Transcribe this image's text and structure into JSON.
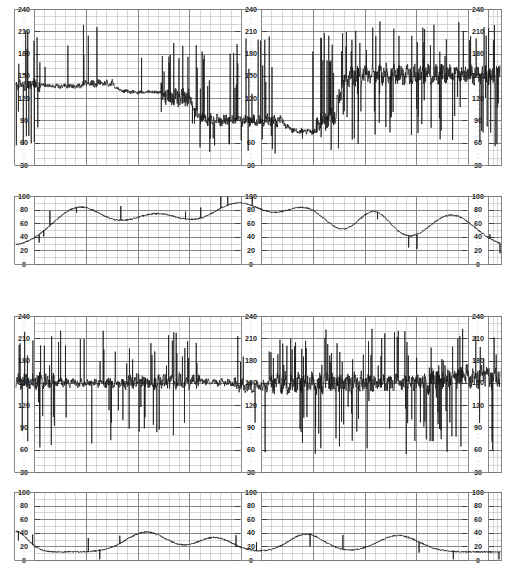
{
  "document": {
    "title": "Cardiotocography (CTG) chart recording",
    "paper": "#ffffff",
    "ink": "#111111",
    "grid_major_color": "#7a7a7a",
    "grid_minor_color": "#b8b8b8",
    "trace_color": "#1a1a1a"
  },
  "panels": [
    {
      "id": "fhr-top",
      "name": "fetal-heart-rate-upper",
      "kind": "fhr",
      "unit": "bpm",
      "y_ticks": [
        240,
        210,
        180,
        150,
        120,
        90,
        60,
        30
      ],
      "ylim": [
        30,
        240
      ],
      "label_columns": [
        "left",
        "middle",
        "right"
      ],
      "minor_cells_x": 40,
      "major_every_x": 5
    },
    {
      "id": "toco-top",
      "name": "uterine-activity-upper",
      "kind": "toco",
      "unit": "",
      "y_ticks": [
        100,
        80,
        60,
        40,
        20,
        0
      ],
      "ylim": [
        0,
        100
      ],
      "label_columns": [
        "left",
        "middle",
        "right"
      ],
      "minor_cells_x": 40,
      "major_every_x": 5
    },
    {
      "id": "fhr-bottom",
      "name": "fetal-heart-rate-lower",
      "kind": "fhr",
      "unit": "bpm",
      "y_ticks": [
        240,
        210,
        180,
        150,
        120,
        90,
        60,
        30
      ],
      "ylim": [
        30,
        240
      ],
      "label_columns": [
        "left",
        "middle",
        "right"
      ],
      "minor_cells_x": 40,
      "major_every_x": 5
    },
    {
      "id": "toco-bottom",
      "name": "uterine-activity-lower",
      "kind": "toco",
      "unit": "",
      "y_ticks": [
        100,
        80,
        60,
        40,
        20,
        0
      ],
      "ylim": [
        0,
        100
      ],
      "label_columns": [
        "left",
        "middle",
        "right"
      ],
      "minor_cells_x": 40,
      "major_every_x": 5
    }
  ],
  "chart_data": [
    {
      "type": "line",
      "id": "fhr-top",
      "title": "Fetal heart rate — upper strip",
      "xlabel": "",
      "ylabel": "bpm",
      "ylim": [
        30,
        240
      ],
      "yticks": [
        30,
        60,
        90,
        120,
        150,
        180,
        210,
        240
      ],
      "grid": true,
      "legend": "none",
      "baseline_segments": [
        {
          "from_pct": 0,
          "to_pct": 5,
          "baseline": 138,
          "variability": 18,
          "spikes": "high"
        },
        {
          "from_pct": 5,
          "to_pct": 13,
          "baseline": 136,
          "variability": 6,
          "spikes": "low"
        },
        {
          "from_pct": 13,
          "to_pct": 20,
          "baseline": 140,
          "variability": 10,
          "spikes": "medium"
        },
        {
          "from_pct": 20,
          "to_pct": 30,
          "baseline": 128,
          "variability": 5,
          "spikes": "low"
        },
        {
          "from_pct": 30,
          "to_pct": 36,
          "baseline": 120,
          "variability": 25,
          "spikes": "high"
        },
        {
          "from_pct": 36,
          "to_pct": 55,
          "baseline": 90,
          "variability": 16,
          "spikes": "high"
        },
        {
          "from_pct": 55,
          "to_pct": 62,
          "baseline": 75,
          "variability": 8,
          "spikes": "low"
        },
        {
          "from_pct": 62,
          "to_pct": 66,
          "baseline": 95,
          "variability": 30,
          "spikes": "high"
        },
        {
          "from_pct": 66,
          "to_pct": 100,
          "baseline": 152,
          "variability": 26,
          "spikes": "high"
        }
      ],
      "annotations": [
        "Prolonged deceleration to ~60-90 bpm in mid strip",
        "Dense signal-loss artefact spikes to 210-240 bpm"
      ]
    },
    {
      "type": "line",
      "id": "toco-top",
      "title": "Uterine activity — upper strip",
      "xlabel": "",
      "ylabel": "",
      "ylim": [
        0,
        100
      ],
      "yticks": [
        0,
        20,
        40,
        60,
        80,
        100
      ],
      "grid": true,
      "legend": "none",
      "resting_tone": 25,
      "contractions": [
        {
          "center_pct": 13,
          "peak": 82,
          "width_pct": 9
        },
        {
          "center_pct": 29,
          "peak": 72,
          "width_pct": 10
        },
        {
          "center_pct": 46,
          "peak": 88,
          "width_pct": 10
        },
        {
          "center_pct": 60,
          "peak": 78,
          "width_pct": 8
        },
        {
          "center_pct": 74,
          "peak": 76,
          "width_pct": 6
        },
        {
          "center_pct": 90,
          "peak": 72,
          "width_pct": 8
        }
      ],
      "annotations": [
        "Six contractions; resting tone ~20-30 units"
      ]
    },
    {
      "type": "line",
      "id": "fhr-bottom",
      "title": "Fetal heart rate — lower strip",
      "xlabel": "",
      "ylabel": "bpm",
      "ylim": [
        30,
        240
      ],
      "yticks": [
        30,
        60,
        90,
        120,
        150,
        180,
        210,
        240
      ],
      "grid": true,
      "legend": "none",
      "baseline_segments": [
        {
          "from_pct": 0,
          "to_pct": 8,
          "baseline": 152,
          "variability": 22,
          "spikes": "high"
        },
        {
          "from_pct": 8,
          "to_pct": 22,
          "baseline": 150,
          "variability": 12,
          "spikes": "medium"
        },
        {
          "from_pct": 22,
          "to_pct": 38,
          "baseline": 152,
          "variability": 20,
          "spikes": "high"
        },
        {
          "from_pct": 38,
          "to_pct": 45,
          "baseline": 150,
          "variability": 10,
          "spikes": "low"
        },
        {
          "from_pct": 45,
          "to_pct": 52,
          "baseline": 145,
          "variability": 16,
          "spikes": "medium"
        },
        {
          "from_pct": 52,
          "to_pct": 72,
          "baseline": 150,
          "variability": 28,
          "spikes": "high"
        },
        {
          "from_pct": 72,
          "to_pct": 85,
          "baseline": 150,
          "variability": 22,
          "spikes": "high"
        },
        {
          "from_pct": 85,
          "to_pct": 100,
          "baseline": 158,
          "variability": 30,
          "spikes": "high"
        }
      ],
      "annotations": [
        "Baseline ~150 bpm throughout with marked artefact spikes 120-215 bpm"
      ]
    },
    {
      "type": "line",
      "id": "toco-bottom",
      "title": "Uterine activity — lower strip",
      "xlabel": "",
      "ylabel": "",
      "ylim": [
        0,
        100
      ],
      "yticks": [
        0,
        20,
        40,
        60,
        80,
        100
      ],
      "grid": true,
      "legend": "none",
      "resting_tone": 12,
      "contractions": [
        {
          "center_pct": 0,
          "peak": 42,
          "width_pct": 4
        },
        {
          "center_pct": 27,
          "peak": 41,
          "width_pct": 7
        },
        {
          "center_pct": 41,
          "peak": 33,
          "width_pct": 6
        },
        {
          "center_pct": 60,
          "peak": 38,
          "width_pct": 6
        },
        {
          "center_pct": 79,
          "peak": 36,
          "width_pct": 7
        }
      ],
      "annotations": [
        "Low-amplitude contractions; resting tone ~10 units"
      ]
    }
  ]
}
